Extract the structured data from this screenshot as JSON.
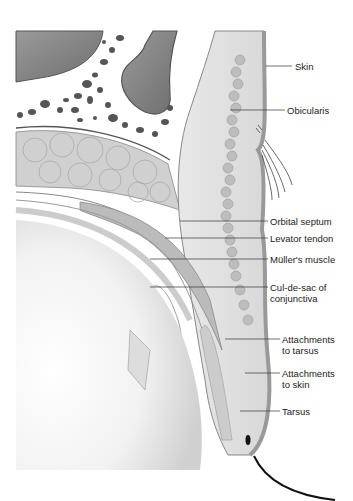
{
  "figure": {
    "labels": [
      {
        "id": "skin",
        "text": "Skin"
      },
      {
        "id": "obicularis",
        "text": "Obicularis"
      },
      {
        "id": "orbital-septum",
        "text": "Orbital septum"
      },
      {
        "id": "levator-tendon",
        "text": "Levator tendon"
      },
      {
        "id": "muller-muscle",
        "text": "Müller's muscle"
      },
      {
        "id": "cul-de-sac",
        "text": "Cul-de-sac of",
        "text2": "conjunctiva"
      },
      {
        "id": "attach-tarsus",
        "text": "Attachments",
        "text2": "to tarsus"
      },
      {
        "id": "attach-skin",
        "text": "Attachments",
        "text2": "to skin"
      },
      {
        "id": "tarsus",
        "text": "Tarsus"
      }
    ],
    "colors": {
      "bone_dark": "#7a7a7a",
      "tissue_light": "#e4e4e4",
      "tissue_mid": "#c8c8c8",
      "skin_edge": "#9a9a9a",
      "fat": "#d6d6d6",
      "line": "#333333"
    }
  }
}
